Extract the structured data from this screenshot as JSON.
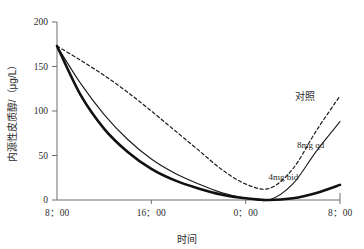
{
  "chart_data": {
    "type": "line",
    "title": "",
    "xlabel": "时间",
    "ylabel": "内源性皮质醇/（μg/L）",
    "ylim": [
      0,
      200
    ],
    "y_ticks": [
      0,
      50,
      100,
      150,
      200
    ],
    "y_tick_labels": [
      "0",
      "50",
      "100",
      "150",
      "200"
    ],
    "x_tick_labels": [
      "8：00",
      "16：00",
      "0：00",
      "8：00"
    ],
    "x_tick_hours": [
      8,
      16,
      24,
      32
    ],
    "xlim_hours": [
      8,
      32
    ],
    "grid": false,
    "legend_position": "inline-annotations",
    "x": [
      8,
      10,
      12,
      14,
      16,
      18,
      20,
      22,
      24,
      26,
      28,
      30,
      32
    ],
    "series": [
      {
        "name": "对照",
        "label": "对照",
        "style": "dashed",
        "color": "#1a1a1a",
        "width": 1.2,
        "values": [
          173,
          157,
          140,
          121,
          100,
          78,
          56,
          34,
          18,
          13,
          35,
          78,
          117
        ]
      },
      {
        "name": "8mg qd",
        "label": "8mg qd",
        "style": "solid-thin",
        "color": "#1a1a1a",
        "width": 1.1,
        "values": [
          173,
          131,
          96,
          68,
          46,
          30,
          18,
          8,
          2,
          0,
          18,
          55,
          88
        ]
      },
      {
        "name": "4mg bid",
        "label": "4mg bid",
        "style": "solid-thick",
        "color": "#111111",
        "width": 2.6,
        "values": [
          173,
          118,
          80,
          54,
          35,
          22,
          13,
          6,
          2,
          0,
          2,
          8,
          17
        ]
      }
    ],
    "annotations": [
      {
        "text": "对照",
        "x_hour": 29.0,
        "y_value": 112
      },
      {
        "text": "8mg qd",
        "x_hour": 29.5,
        "y_value": 58
      },
      {
        "text": "4mg bid",
        "x_hour": 27.2,
        "y_value": 22
      }
    ]
  }
}
